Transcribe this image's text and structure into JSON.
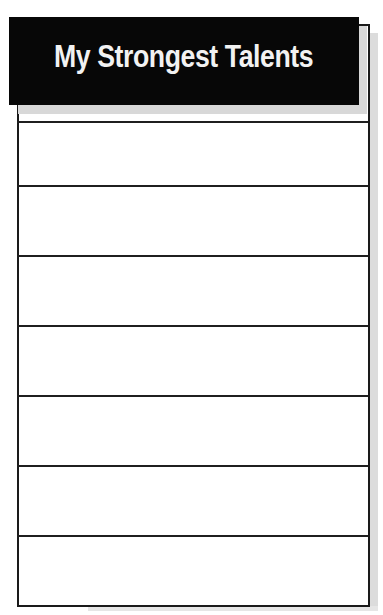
{
  "header": {
    "title": "My Strongest Talents",
    "background": "#070707",
    "text_color": "#f2f2f2"
  },
  "rows": [
    {
      "value": ""
    },
    {
      "value": ""
    },
    {
      "value": ""
    },
    {
      "value": ""
    },
    {
      "value": ""
    },
    {
      "value": ""
    },
    {
      "value": ""
    }
  ]
}
